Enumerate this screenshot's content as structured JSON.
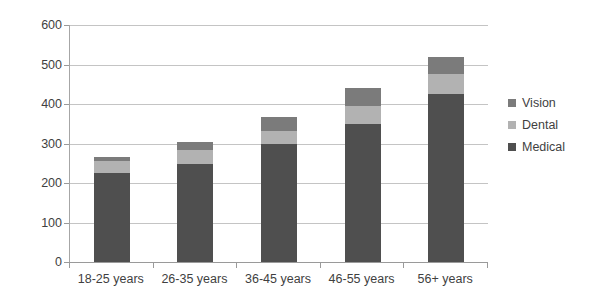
{
  "chart_data": {
    "type": "bar",
    "subtype": "stacked-bar",
    "title": "",
    "xlabel": "",
    "ylabel": "",
    "categories": [
      "18-25 years",
      "26-35 years",
      "36-45 years",
      "46-55 years",
      "56+ years"
    ],
    "series": [
      {
        "name": "Medical",
        "color": "#4f4f4f",
        "values": [
          225,
          248,
          300,
          350,
          425
        ]
      },
      {
        "name": "Dental",
        "color": "#b2b2b2",
        "values": [
          30,
          35,
          32,
          45,
          50
        ]
      },
      {
        "name": "Vision",
        "color": "#7b7b7b",
        "values": [
          12,
          22,
          36,
          45,
          45
        ]
      }
    ],
    "stack_order_bottom_to_top": [
      "Medical",
      "Dental",
      "Vision"
    ],
    "totals": [
      267,
      305,
      368,
      440,
      520
    ],
    "ylim": [
      0,
      600
    ],
    "yticks": [
      0,
      100,
      200,
      300,
      400,
      500,
      600
    ],
    "ytick_labels": [
      "0",
      "100",
      "200",
      "300",
      "400",
      "500",
      "600"
    ],
    "grid": true,
    "grid_axis": "y",
    "legend": true,
    "legend_position": "right",
    "legend_order_top_to_bottom": [
      "Vision",
      "Dental",
      "Medical"
    ],
    "plot_background": "#ffffff",
    "gridline_color": "#c4c4c4",
    "axis_color": "#9a9a9a",
    "text_color": "#3f3f3f"
  }
}
